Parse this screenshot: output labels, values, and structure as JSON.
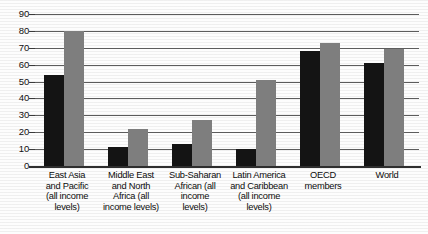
{
  "chart_data": {
    "type": "bar",
    "title": "",
    "subtitle": "",
    "xlabel": "",
    "ylabel": "",
    "ylim": [
      0,
      90
    ],
    "ytick_values": [
      0,
      10,
      20,
      30,
      40,
      50,
      60,
      70,
      80,
      90
    ],
    "ytick_labels": [
      "0",
      "10",
      "20",
      "30",
      "40",
      "50",
      "60",
      "70",
      "80",
      "90"
    ],
    "grid": true,
    "grid_axis": "y",
    "legend": false,
    "legend_position": "none",
    "categories": [
      "East Asia and Pacific (all income levels)",
      "Middle East and North Africa (all income levels)",
      "Sub-Saharan African (all income levels)",
      "Latin America and Caribbean (all income levels)",
      "OECD members",
      "World"
    ],
    "category_lines": [
      [
        "East Asia",
        "and Pacific",
        "(all income",
        "levels)"
      ],
      [
        "Middle East",
        "and North",
        "Africa (all",
        "income levels)"
      ],
      [
        "Sub-Saharan",
        "African (all",
        "income",
        "levels)"
      ],
      [
        "Latin America",
        "and Caribbean",
        "(all income",
        "levels)"
      ],
      [
        "OECD",
        "members"
      ],
      [
        "World"
      ]
    ],
    "series": [
      {
        "name": "series-1",
        "color": "#141414",
        "values": [
          54,
          11,
          13,
          10,
          68,
          61
        ]
      },
      {
        "name": "series-2",
        "color": "#7e7e7e",
        "values": [
          80,
          22,
          27,
          51,
          73,
          69
        ]
      }
    ]
  }
}
